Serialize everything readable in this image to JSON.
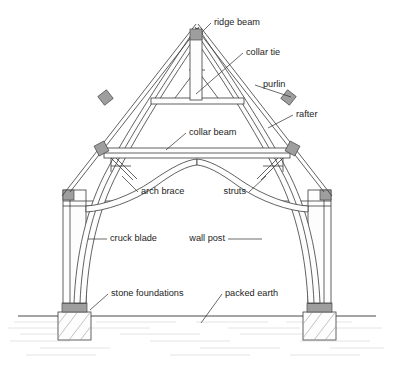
{
  "figure": {
    "background_color": "#ffffff",
    "line_color": "#3a3a3a",
    "joint_color": "#9e9e9e",
    "text_color": "#1d1d1d"
  },
  "labels": {
    "ridge_beam": "ridge beam",
    "collar_tie": "collar tie",
    "purlin": "purlin",
    "rafter": "rafter",
    "collar_beam": "collar beam",
    "arch_brace": "arch brace",
    "struts": "struts",
    "cruck_blade": "cruck blade",
    "wall_post": "wall post",
    "stone_foundations": "stone foundations",
    "packed_earth": "packed earth"
  }
}
